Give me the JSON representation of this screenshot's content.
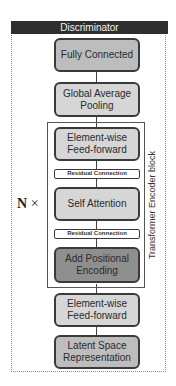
{
  "header": {
    "title": "Discriminator"
  },
  "layers": {
    "fully_connected": "Fully Connected",
    "global_avg_pool": "Global Average Pooling",
    "encoder_ff": "Element-wise Feed-forward",
    "residual_top": "Residual Connection",
    "self_attention": "Self Attention",
    "residual_bottom": "Residual Connection",
    "positional_encoding": "Add Positional Encoding",
    "input_ff": "Element-wise Feed-forward",
    "latent": "Latent Space Representation"
  },
  "block": {
    "label": "Transformer Encoder block",
    "repeat_symbol": "N",
    "repeat_op": "×"
  },
  "colors": {
    "header_bg": "#2f2f2f",
    "box_mid": "#bdbdbd",
    "box_light": "#d6d6d6",
    "box_dark": "#8f8f8f",
    "border": "#3a3a3a"
  }
}
